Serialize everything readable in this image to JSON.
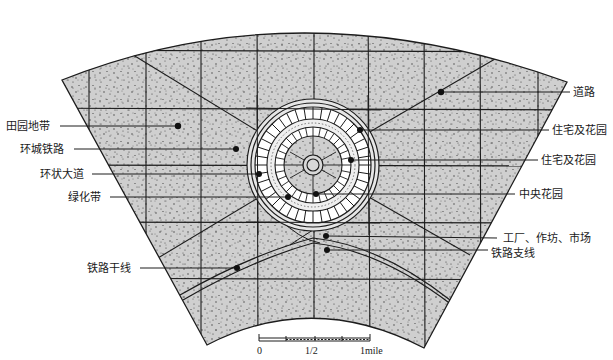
{
  "diagram": {
    "colors": {
      "land_fill": "#cfcfcf",
      "stipple": "#3a3a3a",
      "line": "#1c1c1c",
      "inner_ring_fill": "#ffffff",
      "background": "#ffffff"
    },
    "labels_left": [
      {
        "text": "田园地带",
        "meaning": "agricultural belt"
      },
      {
        "text": "环城铁路",
        "meaning": "circular railway"
      },
      {
        "text": "环状大道",
        "meaning": "grand avenue"
      },
      {
        "text": "绿化带",
        "meaning": "green belt"
      },
      {
        "text": "铁路干线",
        "meaning": "main railway line"
      }
    ],
    "labels_right": [
      {
        "text": "道路",
        "meaning": "road"
      },
      {
        "text": "住宅及花园",
        "meaning": "houses and gardens (outer)"
      },
      {
        "text": "住宅及花园",
        "meaning": "houses and gardens (inner)"
      },
      {
        "text": "中央花园",
        "meaning": "central park"
      },
      {
        "text": "工厂、作坊、市场",
        "meaning": "factories, workshops, markets"
      },
      {
        "text": "铁路支线",
        "meaning": "railway branch line"
      }
    ],
    "scale_bar": {
      "ticks": [
        "0",
        "1/2",
        "1mile"
      ]
    }
  }
}
